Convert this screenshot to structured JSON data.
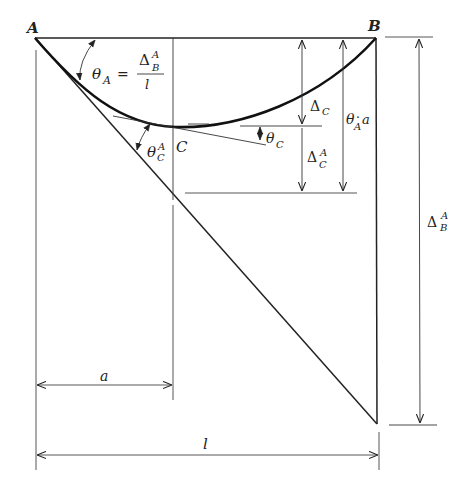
{
  "diagram": {
    "colors": {
      "ink": "#222222",
      "background": "#ffffff"
    },
    "points": {
      "A": "A",
      "B": "B",
      "C": "C"
    },
    "labels": {
      "theta_A_sym": "θ",
      "theta_A_sub": "A",
      "equals": "=",
      "frac_num_delta": "Δ",
      "frac_num_sup": "A",
      "frac_num_sub": "B",
      "frac_den": "l",
      "theta_C_A_sym": "θ",
      "theta_C_A_sup": "A",
      "theta_C_A_sub": "C",
      "theta_C_sym": "θ",
      "theta_C_sub": "C",
      "delta_C_sym": "Δ",
      "delta_C_sub": "C",
      "delta_CA_sym": "Δ",
      "delta_CA_sup": "A",
      "delta_CA_sub": "C",
      "thetaA_a_sym": "θ",
      "thetaA_a_sub": "A",
      "thetaA_a_dot": "·",
      "thetaA_a_a": "a",
      "delta_BA_sym": "Δ",
      "delta_BA_sup": "A",
      "delta_BA_sub": "B",
      "dim_a": "a",
      "dim_l": "l"
    },
    "elements": [
      "beam chord A–B",
      "elastic curve A–C–B",
      "tangent at A",
      "tangent at C",
      "vertical through C",
      "vertical through B",
      "dimension Δ_C",
      "dimension Δ_C^A",
      "dimension θ_A·a",
      "dimension Δ_B^A",
      "dimension a",
      "dimension l"
    ]
  }
}
